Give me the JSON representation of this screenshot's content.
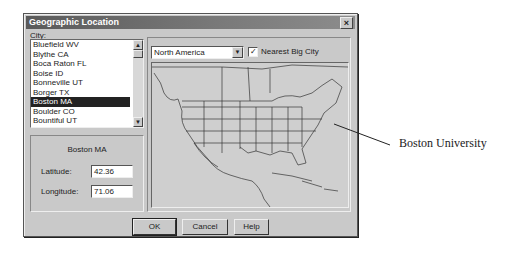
{
  "dialog": {
    "title": "Geographic Location",
    "close_icon": "close-icon"
  },
  "city": {
    "label": "City:",
    "items": [
      "Bluefield WV",
      "Blythe  CA",
      "Boca Raton FL",
      "Boise ID",
      "Bonneville  UT",
      "Borger  TX",
      "Boston MA",
      "Boulder CO",
      "Bountiful UT"
    ],
    "selected": "Boston MA"
  },
  "location": {
    "city_name": "Boston MA",
    "latitude_label": "Latitude:",
    "latitude_value": "42.36",
    "longitude_label": "Longitude:",
    "longitude_value": "71.06"
  },
  "map_panel": {
    "region_select": "North America",
    "nearest_big_city_label": "Nearest Big City",
    "nearest_big_city_checked": true
  },
  "buttons": {
    "ok": "OK",
    "cancel": "Cancel",
    "help": "Help"
  },
  "annotation": {
    "label": "Boston University"
  }
}
